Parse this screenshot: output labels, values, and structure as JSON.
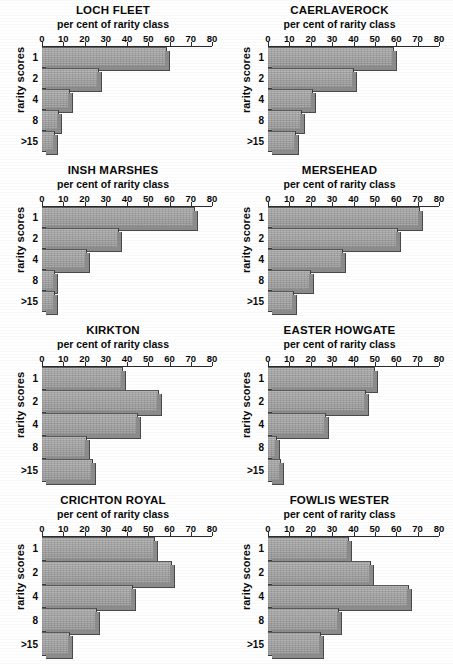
{
  "figure": {
    "axis_title": "per cent of rarity class",
    "yaxis_title": "rarity scores",
    "categories": [
      "1",
      "2",
      "4",
      "8",
      ">15"
    ],
    "xticks": [
      0,
      10,
      20,
      30,
      40,
      50,
      60,
      70,
      80
    ],
    "xlim": [
      0,
      80
    ],
    "bar_color": "#a2a2a2",
    "axis_color": "#2b2b2b"
  },
  "chart_data": [
    {
      "type": "bar",
      "orientation": "horizontal",
      "title": "LOCH FLEET",
      "xlabel": "per cent of rarity class",
      "ylabel": "rarity scores",
      "categories": [
        "1",
        "2",
        "4",
        "8",
        ">15"
      ],
      "values": [
        59,
        27,
        13,
        8,
        6
      ],
      "xlim": [
        0,
        80
      ],
      "xticks": [
        0,
        10,
        20,
        30,
        40,
        50,
        60,
        70,
        80
      ],
      "grid": false,
      "legend": "none"
    },
    {
      "type": "bar",
      "orientation": "horizontal",
      "title": "CAERLAVEROCK",
      "xlabel": "per cent of rarity class",
      "ylabel": "rarity scores",
      "categories": [
        "1",
        "2",
        "4",
        "8",
        ">15"
      ],
      "values": [
        59,
        40,
        21,
        16,
        13
      ],
      "xlim": [
        0,
        80
      ],
      "xticks": [
        0,
        10,
        20,
        30,
        40,
        50,
        60,
        70,
        80
      ],
      "grid": false,
      "legend": "none"
    },
    {
      "type": "bar",
      "orientation": "horizontal",
      "title": "INSH MARSHES",
      "xlabel": "per cent of rarity class",
      "ylabel": "rarity scores",
      "categories": [
        "1",
        "2",
        "4",
        "8",
        ">15"
      ],
      "values": [
        72,
        36,
        21,
        6,
        6
      ],
      "xlim": [
        0,
        80
      ],
      "xticks": [
        0,
        10,
        20,
        30,
        40,
        50,
        60,
        70,
        80
      ],
      "grid": false,
      "legend": "none"
    },
    {
      "type": "bar",
      "orientation": "horizontal",
      "title": "MERSEHEAD",
      "xlabel": "per cent of rarity class",
      "ylabel": "rarity scores",
      "categories": [
        "1",
        "2",
        "4",
        "8",
        ">15"
      ],
      "values": [
        71,
        61,
        35,
        20,
        12
      ],
      "xlim": [
        0,
        80
      ],
      "xticks": [
        0,
        10,
        20,
        30,
        40,
        50,
        60,
        70,
        80
      ],
      "grid": false,
      "legend": "none"
    },
    {
      "type": "bar",
      "orientation": "horizontal",
      "title": "KIRKTON",
      "xlabel": "per cent of rarity class",
      "ylabel": "rarity scores",
      "categories": [
        "1",
        "2",
        "4",
        "8",
        ">15"
      ],
      "values": [
        38,
        55,
        45,
        21,
        24
      ],
      "xlim": [
        0,
        80
      ],
      "xticks": [
        0,
        10,
        20,
        30,
        40,
        50,
        60,
        70,
        80
      ],
      "grid": false,
      "legend": "none"
    },
    {
      "type": "bar",
      "orientation": "horizontal",
      "title": "EASTER HOWGATE",
      "xlabel": "per cent of rarity class",
      "ylabel": "rarity scores",
      "categories": [
        "1",
        "2",
        "4",
        "8",
        ">15"
      ],
      "values": [
        50,
        46,
        27,
        4,
        6
      ],
      "xlim": [
        0,
        80
      ],
      "xticks": [
        0,
        10,
        20,
        30,
        40,
        50,
        60,
        70,
        80
      ],
      "grid": false,
      "legend": "none"
    },
    {
      "type": "bar",
      "orientation": "horizontal",
      "title": "CRICHTON ROYAL",
      "xlabel": "per cent of rarity class",
      "ylabel": "rarity scores",
      "categories": [
        "1",
        "2",
        "4",
        "8",
        ">15"
      ],
      "values": [
        53,
        61,
        43,
        26,
        13
      ],
      "xlim": [
        0,
        80
      ],
      "xticks": [
        0,
        10,
        20,
        30,
        40,
        50,
        60,
        70,
        80
      ],
      "grid": false,
      "legend": "none"
    },
    {
      "type": "bar",
      "orientation": "horizontal",
      "title": "FOWLIS WESTER",
      "xlabel": "per cent of rarity class",
      "ylabel": "rarity scores",
      "categories": [
        "1",
        "2",
        "4",
        "8",
        ">15"
      ],
      "values": [
        38,
        48,
        66,
        33,
        25
      ],
      "xlim": [
        0,
        80
      ],
      "xticks": [
        0,
        10,
        20,
        30,
        40,
        50,
        60,
        70,
        80
      ],
      "grid": false,
      "legend": "none"
    }
  ]
}
